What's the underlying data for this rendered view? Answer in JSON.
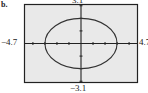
{
  "part_label": "b.",
  "window": {
    "xmin_label": "−4.7",
    "xmax_label": "4.7",
    "ymin_label": "−3.1",
    "ymax_label": "3.1"
  },
  "colors": {
    "background": "#e9e9e9",
    "frame": "#222222",
    "curve": "#333333"
  },
  "chart_data": {
    "type": "line",
    "title": "",
    "xlabel": "",
    "ylabel": "",
    "xlim": [
      -4.7,
      4.7
    ],
    "ylim": [
      -3.1,
      3.1
    ],
    "grid": false,
    "x_ticks_step": 1,
    "y_ticks_step": 1,
    "tick_labels": {
      "xmin": "-4.7",
      "xmax": "4.7",
      "ymin": "-3.1",
      "ymax": "3.1"
    },
    "series": [
      {
        "name": "ellipse",
        "shape": "ellipse",
        "center": [
          0,
          0
        ],
        "x_radius": 3,
        "y_radius": 2,
        "intercepts": {
          "x": [
            -3,
            3
          ],
          "y": [
            -2,
            2
          ]
        }
      }
    ]
  }
}
